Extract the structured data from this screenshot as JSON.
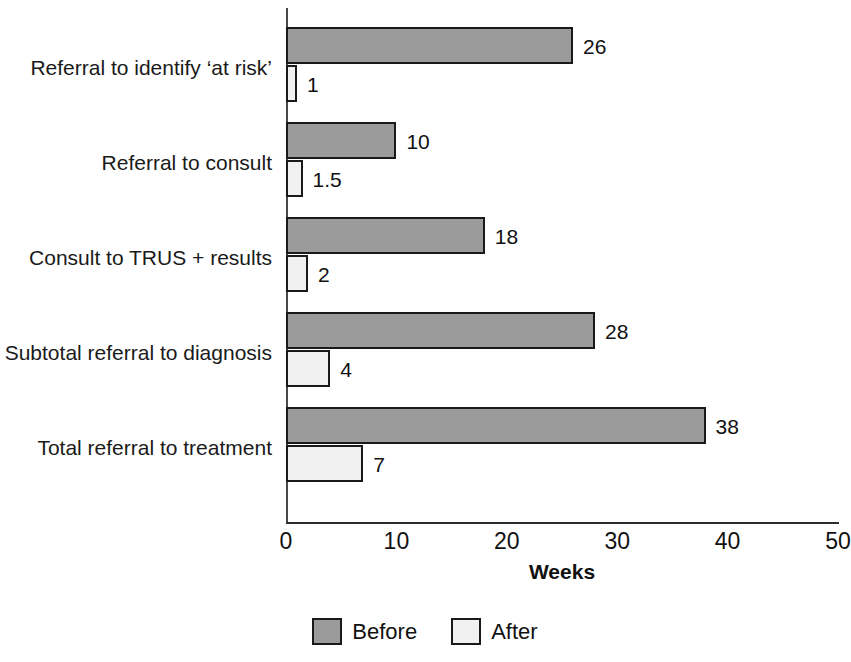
{
  "chart_data": {
    "type": "bar",
    "orientation": "horizontal",
    "title": "",
    "xlabel": "Weeks",
    "ylabel": "",
    "xlim": [
      0,
      50
    ],
    "xticks": [
      0,
      10,
      20,
      30,
      40,
      50
    ],
    "xtick_labels": [
      "0",
      "10",
      "20",
      "30",
      "40",
      "50"
    ],
    "grid": false,
    "legend_position": "bottom-center",
    "categories": [
      "Referral to identify ‘at risk’",
      "Referral to consult",
      "Consult to TRUS + results",
      "Subtotal referral to diagnosis",
      "Total referral to treatment"
    ],
    "series": [
      {
        "name": "Before",
        "color": "#9b9b9b",
        "values": [
          26,
          10,
          18,
          28,
          38
        ],
        "value_labels": [
          "26",
          "10",
          "18",
          "28",
          "38"
        ]
      },
      {
        "name": "After",
        "color": "#f1f1f1",
        "values": [
          1,
          1.5,
          2,
          4,
          7
        ],
        "value_labels": [
          "1",
          "1.5",
          "2",
          "4",
          "7"
        ]
      }
    ]
  },
  "legend": {
    "items": [
      {
        "label": "Before",
        "color": "#9b9b9b"
      },
      {
        "label": "After",
        "color": "#f1f1f1"
      }
    ]
  },
  "axis": {
    "x_title": "Weeks"
  },
  "colors": {
    "before_fill": "#9b9b9b",
    "after_fill": "#f1f1f1",
    "bar_stroke": "#1a1a1a",
    "axis": "#2b2b2b",
    "text": "#111111",
    "background": "#ffffff"
  }
}
